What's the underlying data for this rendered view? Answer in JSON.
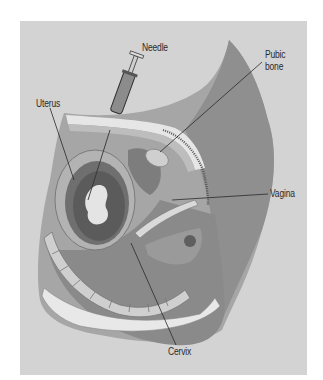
{
  "diagram": {
    "type": "anatomical-illustration",
    "labels": {
      "needle": "Needle",
      "pubic_bone_line1": "Pubic",
      "pubic_bone_line2": "bone",
      "uterus": "Uterus",
      "vagina": "Vagina",
      "cervix": "Cervix"
    },
    "colors": {
      "background": "#d3d3d3",
      "body_dark": "#8e8e8e",
      "body_mid": "#a8a8a8",
      "tissue_light": "#e8e8e8",
      "leader_line": "#2a2a2a",
      "text": "#2a2a2a"
    }
  }
}
